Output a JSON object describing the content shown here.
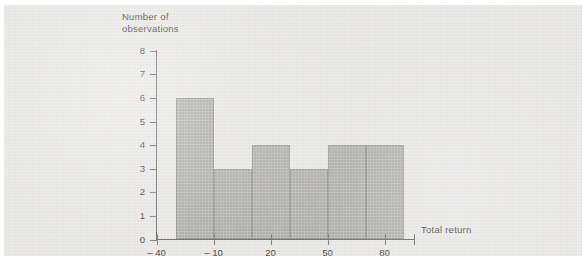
{
  "chart_data": {
    "type": "bar",
    "title": "",
    "subtitle": "",
    "xlabel": "Total return",
    "ylabel": "Number of observations",
    "ylabel_lines": [
      "Number of",
      "observations"
    ],
    "grid": false,
    "legend": "none",
    "bin_width": 20,
    "bin_edges": [
      -30,
      -10,
      10,
      30,
      50,
      70
    ],
    "categories": [
      "-30 to -10",
      "-10 to 10",
      "10 to 30",
      "30 to 50",
      "50 to 70",
      "70 to 90"
    ],
    "values": [
      6,
      3,
      4,
      3,
      4,
      4
    ],
    "bar_starts": [
      -30,
      -10,
      10,
      30,
      50,
      70
    ],
    "bar_ends": [
      -10,
      10,
      30,
      50,
      70,
      90
    ],
    "xlim": [
      -40,
      85
    ],
    "ylim": [
      0,
      8
    ],
    "x_ticks": [
      -40,
      -10,
      20,
      50,
      80
    ],
    "x_tick_labels": [
      "– 40",
      "– 10",
      "20",
      "50",
      "80"
    ],
    "y_ticks": [
      0,
      1,
      2,
      3,
      4,
      5,
      6,
      7,
      8
    ],
    "y_tick_labels": [
      "0",
      "1",
      "2",
      "3",
      "4",
      "5",
      "6",
      "7",
      "8"
    ],
    "colors": {
      "bar_fill": "#a9a8a5",
      "bar_edge": "#8e8d8a",
      "axis": "#5c5c5c",
      "text": "#2b2b2b",
      "panel_background": "#e7e6e3",
      "page_background": "#ffffff"
    }
  }
}
